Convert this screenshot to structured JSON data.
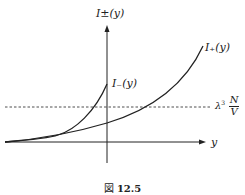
{
  "figure": {
    "caption_prefix": "図",
    "caption_number": "12.5",
    "y_axis_label": "I±(y)",
    "x_axis_label": "y",
    "curves": [
      {
        "name": "I₊(y)",
        "label": "I₊(y)"
      },
      {
        "name": "I₋(y)",
        "label": "I₋(y)"
      }
    ],
    "threshold": {
      "lambda": "λ",
      "lambda_sup": "3",
      "lambda_sub": "T",
      "numerator": "N",
      "denominator": "V",
      "style": "dashed"
    },
    "colors": {
      "line": "#222222",
      "background": "#ffffff"
    }
  }
}
